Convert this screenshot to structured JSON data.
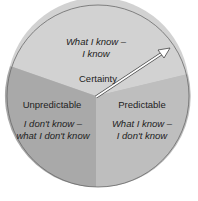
{
  "diagram": {
    "type": "segmented-circle",
    "sectors": [
      {
        "id": "certainty",
        "title": "Certainty",
        "description_line1": "What I know –",
        "description_line2": "I know",
        "color": "#d2d2d2"
      },
      {
        "id": "unpredictable",
        "title": "Unpredictable",
        "description_line1": "I don't know –",
        "description_line2": "what I don't know",
        "color": "#a9a9a9"
      },
      {
        "id": "predictable",
        "title": "Predictable",
        "description_line1": "What I know –",
        "description_line2": "I don't know",
        "color": "#bebebe"
      }
    ],
    "arrow": {
      "direction": "center to upper-right edge",
      "color": "#ffffff",
      "outline": "#444444"
    },
    "outline_color": "#6a6a6a"
  }
}
